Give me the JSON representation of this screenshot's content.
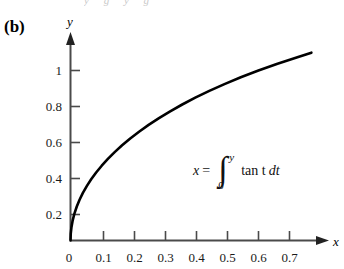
{
  "figure": {
    "panel_label": "(b)",
    "ghost_text": "y g y g",
    "formula": {
      "lhs": "x",
      "equals": "=",
      "integral_sign": "∫",
      "upper_limit": "y",
      "lower_limit": "0",
      "integrand": "tan t",
      "differential": "dt",
      "plain": "x = ∫₀ʸ tan t dt"
    },
    "curve_color": "#000000",
    "axis_color": "#4a4a4a",
    "background": "#ffffff"
  },
  "chart_data": {
    "type": "line",
    "title": "",
    "xlabel": "x",
    "ylabel": "y",
    "xlim": [
      0,
      0.78
    ],
    "ylim": [
      0,
      1.18
    ],
    "grid": false,
    "legend": null,
    "xticks": [
      "0",
      "0.1",
      "0.2",
      "0.3",
      "0.4",
      "0.5",
      "0.6",
      "0.7"
    ],
    "xtick_values": [
      0,
      0.1,
      0.2,
      0.3,
      0.4,
      0.5,
      0.6,
      0.7
    ],
    "yticks": [
      "0",
      "0.2",
      "0.4",
      "0.6",
      "0.8",
      "1"
    ],
    "ytick_values": [
      0,
      0.2,
      0.4,
      0.6,
      0.8,
      1
    ],
    "series": [
      {
        "name": "x = ∫₀ʸ tan t dt",
        "x": [
          0.0,
          0.0008,
          0.0032,
          0.0072,
          0.0128,
          0.0201,
          0.029,
          0.0396,
          0.052,
          0.0661,
          0.082,
          0.0998,
          0.1195,
          0.1412,
          0.165,
          0.1909,
          0.2191,
          0.2497,
          0.2828,
          0.3186,
          0.3572,
          0.3988,
          0.4437,
          0.4921,
          0.5443,
          0.6007,
          0.6617,
          0.7277,
          0.77
        ],
        "y": [
          0.0,
          0.04,
          0.08,
          0.12,
          0.16,
          0.2,
          0.24,
          0.28,
          0.32,
          0.36,
          0.4,
          0.44,
          0.48,
          0.52,
          0.56,
          0.6,
          0.64,
          0.68,
          0.72,
          0.76,
          0.8,
          0.84,
          0.88,
          0.92,
          0.96,
          1.0,
          1.04,
          1.08,
          1.105
        ]
      }
    ]
  }
}
